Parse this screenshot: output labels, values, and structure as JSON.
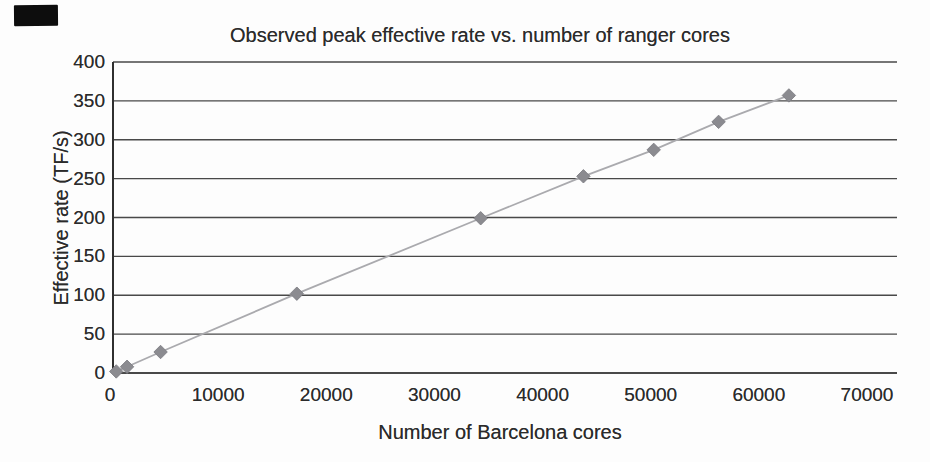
{
  "chart_data": {
    "type": "line",
    "marker_shape": "diamond",
    "title": "Observed peak effective rate vs. number of ranger cores",
    "xlabel": "Number of Barcelona cores",
    "ylabel": "Effective rate (TF/s)",
    "x": [
      300,
      1300,
      4400,
      17000,
      34000,
      43500,
      50000,
      56000,
      62500
    ],
    "y": [
      2,
      8,
      27,
      102,
      199,
      253,
      287,
      323,
      357
    ],
    "x_ticks": [
      0,
      10000,
      20000,
      30000,
      40000,
      50000,
      60000,
      70000
    ],
    "y_ticks": [
      0,
      50,
      100,
      150,
      200,
      250,
      300,
      350,
      400
    ],
    "xlim": [
      0,
      72500
    ],
    "ylim": [
      0,
      400
    ],
    "grid": "horizontal-only",
    "legend": "none",
    "colors": {
      "marker": "#8b8b90",
      "marker_edge": "#7c7c82",
      "series_line": "#aaaaae",
      "gridline": "#3a3a3a",
      "axis": "#2f2f2f",
      "text": "#2b2b2b",
      "background": "#fdfdfd",
      "scan_mark": "#0d0d0d"
    }
  }
}
